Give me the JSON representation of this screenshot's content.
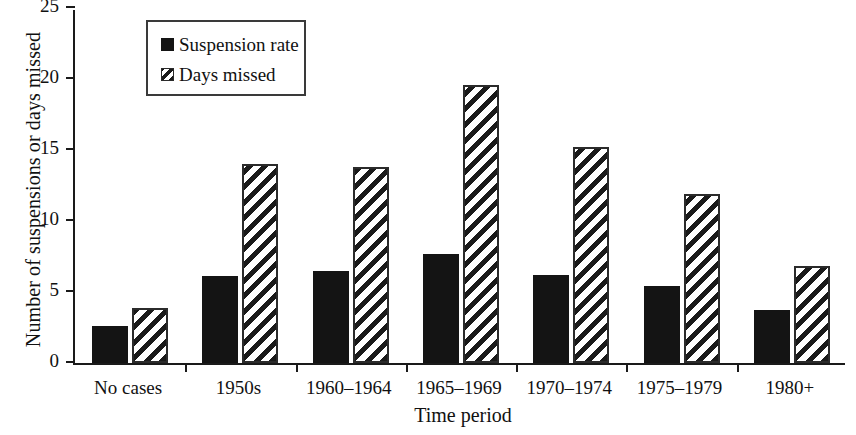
{
  "chart_data": {
    "type": "bar",
    "title": "",
    "xlabel": "Time period",
    "ylabel": "Number of suspensions or days missed",
    "categories": [
      "No cases",
      "1950s",
      "1960–1964",
      "1965–1969",
      "1970–1974",
      "1975–1979",
      "1980+"
    ],
    "series": [
      {
        "name": "Suspension rate",
        "fill": "solid-black",
        "values": [
          2.6,
          6.1,
          6.5,
          7.7,
          6.2,
          5.4,
          3.7
        ]
      },
      {
        "name": "Days missed",
        "fill": "diagonal-hatch",
        "values": [
          3.9,
          14.0,
          13.8,
          19.6,
          15.2,
          11.9,
          6.8
        ]
      }
    ],
    "ylim": [
      0,
      25
    ],
    "yticks": [
      0,
      5,
      10,
      15,
      20,
      25
    ],
    "ytick_labels": [
      "0",
      "5",
      "10",
      "15",
      "20",
      "25"
    ],
    "grid": false,
    "legend_position": "upper-left-inside",
    "colors": {
      "suspension_rate": "#141414",
      "days_missed": "#ffffff",
      "axis": "#1a1a1a",
      "background": "#ffffff"
    }
  },
  "legend": {
    "entries": [
      {
        "label": "Suspension rate"
      },
      {
        "label": "Days missed"
      }
    ]
  },
  "axes": {
    "y_title": "Number of suspensions or days missed",
    "x_title": "Time period"
  }
}
